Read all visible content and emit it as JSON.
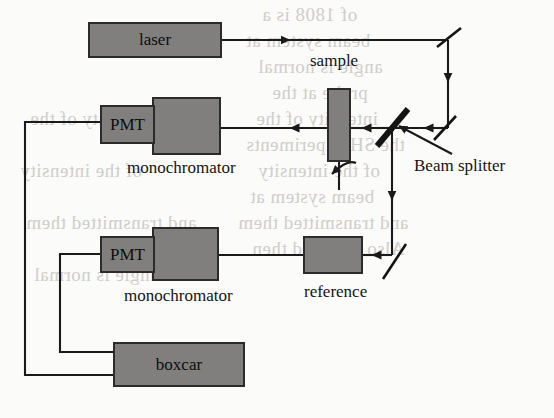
{
  "figure": {
    "background_color": "#fbfbfa",
    "block_fill": "#807f7d",
    "line_color": "#1a1a1a"
  },
  "blocks": {
    "laser": {
      "label": "laser",
      "x": 88,
      "y": 22,
      "w": 134,
      "h": 36
    },
    "pmt_top": {
      "label": "PMT",
      "x": 100,
      "y": 105,
      "w": 55,
      "h": 39
    },
    "monochromator_top": {
      "label": "",
      "x": 152,
      "y": 97,
      "w": 69,
      "h": 58
    },
    "pmt_bottom": {
      "label": "PMT",
      "x": 100,
      "y": 236,
      "w": 55,
      "h": 37
    },
    "monochromator_bottom": {
      "label": "",
      "x": 152,
      "y": 227,
      "w": 67,
      "h": 54
    },
    "boxcar": {
      "label": "boxcar",
      "x": 113,
      "y": 342,
      "w": 132,
      "h": 45
    },
    "sample": {
      "label": "",
      "x": 327,
      "y": 88,
      "w": 24,
      "h": 74
    },
    "reference": {
      "label": "",
      "x": 303,
      "y": 236,
      "w": 60,
      "h": 38
    }
  },
  "labels": {
    "sample": {
      "text": "sample",
      "x": 310,
      "y": 61
    },
    "monochromator_top": {
      "text": "monochromator",
      "x": 127,
      "y": 160
    },
    "monochromator_bottom": {
      "text": "monochromator",
      "x": 124,
      "y": 288
    },
    "reference": {
      "text": "reference",
      "x": 304,
      "y": 284
    },
    "beam_splitter": {
      "text": "Beam splitter",
      "x": 414,
      "y": 158
    }
  },
  "optics": {
    "beam_splitter": {
      "name": "beam-splitter",
      "cx": 392,
      "cy": 127
    },
    "mirror_top_right": {
      "name": "mirror-top-right",
      "cx": 448,
      "cy": 38
    },
    "mirror_mid_right": {
      "name": "mirror-mid-right",
      "cx": 445,
      "cy": 128
    },
    "mirror_bottom_right": {
      "name": "mirror-bottom-right",
      "cx": 394,
      "cy": 262
    }
  },
  "beam_paths": [
    {
      "name": "laser-to-top-mirror",
      "description": "horizontal beam from laser to upper right mirror"
    },
    {
      "name": "top-mirror-down",
      "description": "vertical beam descending to mid right mirror"
    },
    {
      "name": "mid-mirror-to-beam-splitter",
      "description": "horizontal beam travelling left into the beam splitter"
    },
    {
      "name": "beam-splitter-to-sample",
      "description": "transmitted beam through sample into upper monochromator and PMT"
    },
    {
      "name": "beam-splitter-down",
      "description": "reflected beam descending to lower mirror"
    },
    {
      "name": "lower-mirror-to-reference",
      "description": "beam travelling left through reference into lower monochromator and PMT"
    },
    {
      "name": "sample-emission",
      "description": "curved arrow showing scattered emission leaving the sample"
    }
  ],
  "signal_wires": [
    {
      "name": "top-pmt-to-boxcar",
      "description": "outer wire from upper PMT left around to boxcar bottom edge"
    },
    {
      "name": "bottom-pmt-to-boxcar",
      "description": "inner wire from lower PMT left around to boxcar left edge"
    }
  ],
  "bleed_text": [
    {
      "text": "of  1808  is  a",
      "x": 262,
      "y": 14
    },
    {
      "text": "beam  system  at",
      "x": 246,
      "y": 40
    },
    {
      "text": "angle  is  normal",
      "x": 258,
      "y": 66
    },
    {
      "text": "probe  at  the",
      "x": 272,
      "y": 92
    },
    {
      "text": "intensity  of  the",
      "x": 256,
      "y": 118
    },
    {
      "text": "the  SH  experiments",
      "x": 246,
      "y": 144
    },
    {
      "text": "of  the  intensity",
      "x": 258,
      "y": 170
    },
    {
      "text": "beam  system  at",
      "x": 250,
      "y": 196
    },
    {
      "text": "and  transmitted  them",
      "x": 238,
      "y": 222
    },
    {
      "text": "Also  obtained  then",
      "x": 252,
      "y": 248
    }
  ]
}
